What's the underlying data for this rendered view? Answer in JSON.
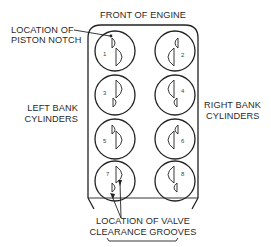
{
  "diagram": {
    "title": "FRONT OF ENGINE",
    "labels": {
      "piston_notch_line1": "LOCATION OF",
      "piston_notch_line2": "PISTON NOTCH",
      "left_bank_line1": "LEFT BANK",
      "left_bank_line2": "CYLINDERS",
      "right_bank_line1": "RIGHT BANK",
      "right_bank_line2": "CYLINDERS",
      "valve_grooves_line1": "LOCATION OF VALVE",
      "valve_grooves_line2": "CLEARANCE GROOVES"
    },
    "cylinders": {
      "left_bank": [
        "1",
        "3",
        "5",
        "7"
      ],
      "right_bank": [
        "2",
        "4",
        "6",
        "8"
      ]
    },
    "colors": {
      "line": "#222222",
      "text": "#2a2a2a",
      "background": "#ffffff"
    }
  }
}
